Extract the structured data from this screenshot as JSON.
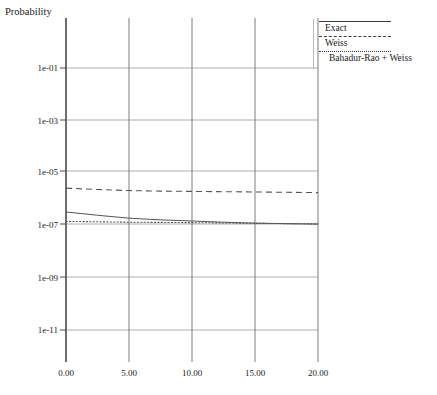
{
  "chart_data": {
    "type": "line",
    "title": "",
    "xlabel": "Buffer/Source (cells)",
    "ylabel": "Probability",
    "yscale": "log",
    "xlim": [
      0.0,
      20.0
    ],
    "ylim": [
      1e-12,
      1.0
    ],
    "grid": true,
    "legend_position": "top-right",
    "x_ticks": [
      "0.00",
      "5.00",
      "10.00",
      "15.00",
      "20.00"
    ],
    "x_tick_values": [
      0.0,
      5.0,
      10.0,
      15.0,
      20.0
    ],
    "y_ticks": [
      "1e-01",
      "1e-03",
      "1e-05",
      "1e-07",
      "1e-09",
      "1e-11"
    ],
    "y_tick_values": [
      0.1,
      0.001,
      1e-05,
      1e-07,
      1e-09,
      1e-11
    ],
    "x": [
      0.0,
      2.5,
      5.0,
      7.5,
      10.0,
      12.5,
      15.0,
      17.5,
      20.0
    ],
    "series": [
      {
        "name": "Exact",
        "style": "solid",
        "color": "#555555",
        "values": [
          3.2e-07,
          2.4e-07,
          1.85e-07,
          1.6e-07,
          1.45e-07,
          1.3e-07,
          1.2e-07,
          1.15e-07,
          1.1e-07
        ]
      },
      {
        "name": "Weiss",
        "style": "dashed",
        "color": "#555555",
        "values": [
          2.6e-06,
          2.3e-06,
          2.1e-06,
          2e-06,
          1.95e-06,
          1.9e-06,
          1.85e-06,
          1.8e-06,
          1.75e-06
        ]
      },
      {
        "name": "Bahadur-Rao + Weiss",
        "style": "dotted",
        "color": "#555555",
        "values": [
          1.4e-07,
          1.35e-07,
          1.3e-07,
          1.28e-07,
          1.25e-07,
          1.22e-07,
          1.18e-07,
          1.15e-07,
          1.12e-07
        ]
      }
    ]
  },
  "axes": {
    "y_title": "Probability",
    "x_title": "Buffer/Source (cells)",
    "y_tick_labels": [
      "1e-01",
      "1e-03",
      "1e-05",
      "1e-07",
      "1e-09",
      "1e-11"
    ],
    "x_tick_labels": [
      "0.00",
      "5.00",
      "10.00",
      "15.00",
      "20.00"
    ]
  },
  "legend": {
    "entries": [
      {
        "label": "Exact",
        "style": "solid"
      },
      {
        "label": "Weiss",
        "style": "dashed"
      },
      {
        "label": "Bahadur-Rao + Weiss",
        "style": "dotted"
      }
    ]
  },
  "colors": {
    "axis": "#4a4a4a",
    "grid": "#9a9a9a",
    "curve": "#555555",
    "text": "#1a1a1a",
    "background": "#ffffff"
  }
}
